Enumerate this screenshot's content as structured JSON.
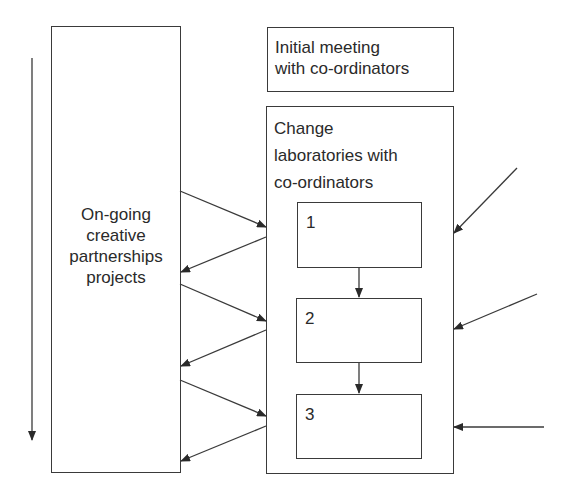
{
  "diagram": {
    "left_box": {
      "label_lines": [
        "On-going",
        "creative",
        "partnerships",
        "projects"
      ]
    },
    "top_right_box": {
      "label_lines": [
        "Initial meeting",
        "with co-ordinators"
      ]
    },
    "change_lab_box": {
      "label_lines": [
        "Change",
        "laboratories with",
        "co-ordinators"
      ],
      "steps": [
        {
          "label": "1"
        },
        {
          "label": "2"
        },
        {
          "label": "3"
        }
      ]
    },
    "arrows": {
      "time_arrow": "vertical downward arrow left of projects box",
      "left_exchanges": 6,
      "right_inputs": 3,
      "step_flows": 2
    },
    "colors": {
      "stroke": "#3a3a3a",
      "text": "#2a2a2a",
      "background": "#ffffff"
    }
  }
}
